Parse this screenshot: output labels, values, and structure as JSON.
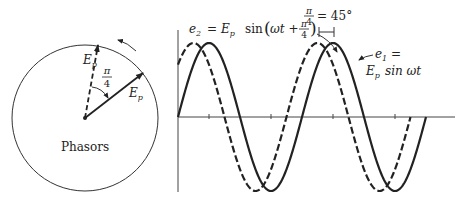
{
  "phasor_diagram": {
    "caption": "Phasors",
    "phasor_label": "E",
    "phasor_subscript": "p",
    "angle_label_num": "π",
    "angle_label_den": "4",
    "rotation": "counterclockwise",
    "phasors": [
      {
        "name": "e1",
        "style": "solid",
        "angle_deg": 45
      },
      {
        "name": "e2",
        "style": "dashed",
        "angle_deg": 90
      }
    ]
  },
  "waveform": {
    "e2_label": {
      "lhs": "e",
      "lhs_sub": "2",
      "eq": "=",
      "amp": "E",
      "amp_sub": "p",
      "func": "sin",
      "arg": "ωt +",
      "frac_num": "π",
      "frac_den": "4"
    },
    "e1_label": {
      "line1_lhs": "e",
      "line1_sub": "1",
      "line1_eq": "=",
      "line2_amp": "E",
      "line2_sub": "p",
      "line2_func": "sin ωt"
    },
    "phase_label": {
      "frac_num": "π",
      "frac_den": "4",
      "rhs": "= 45°"
    }
  },
  "chart_data": {
    "type": "line",
    "title": "",
    "xlabel": "",
    "ylabel": "",
    "x_unit": "radians",
    "xlim": [
      0,
      12.1
    ],
    "ylim": [
      -1,
      1
    ],
    "grid": false,
    "tick_positions_rad": [
      1.5708,
      4.7124,
      7.854,
      10.9956
    ],
    "series": [
      {
        "name": "e1 = Ep sin ωt",
        "style": "solid",
        "amplitude": 1,
        "phase_rad": 0,
        "x_end_rad": 12.566
      },
      {
        "name": "e2 = Ep sin(ωt + π/4)",
        "style": "dashed",
        "amplitude": 1,
        "phase_rad": 0.7854,
        "x_end_rad": 11.781
      }
    ],
    "annotations": [
      "π/4 = 45°"
    ]
  }
}
